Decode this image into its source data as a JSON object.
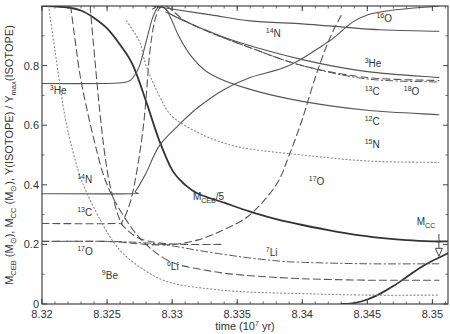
{
  "chart_data": {
    "type": "line",
    "title": "",
    "xlabel": "time (10^7 yr)",
    "xlabel_parts": {
      "base": "time (10",
      "sup": "7",
      "tail": " yr)"
    },
    "ylabel": "M_CEB (M_sun), M_CC (M_sun), Y(ISOTOPE)/Y_max(ISOTOPE)",
    "xlim": [
      8.32,
      8.3512
    ],
    "ylim": [
      0,
      1.0
    ],
    "x_ticks": [
      {
        "value": 8.32,
        "label": "8.32"
      },
      {
        "value": 8.325,
        "label": "8.325"
      },
      {
        "value": 8.33,
        "label": "8.33"
      },
      {
        "value": 8.335,
        "label": "8.335"
      },
      {
        "value": 8.34,
        "label": "8.34"
      },
      {
        "value": 8.345,
        "label": "8.345"
      },
      {
        "value": 8.35,
        "label": "8.35"
      }
    ],
    "y_ticks": [
      {
        "value": 0,
        "label": "0"
      },
      {
        "value": 0.2,
        "label": "0.2"
      },
      {
        "value": 0.4,
        "label": "0.4"
      },
      {
        "value": 0.6,
        "label": "0.6"
      },
      {
        "value": 0.8,
        "label": "0.8"
      }
    ],
    "grid": false,
    "legend": "inline labels",
    "series": [
      {
        "name": "M_CEB/5",
        "style": "solid-thick",
        "x": [
          8.32,
          8.322,
          8.323,
          8.324,
          8.325,
          8.326,
          8.327,
          8.328,
          8.329,
          8.33,
          8.331,
          8.332,
          8.334,
          8.336,
          8.338,
          8.34,
          8.342,
          8.344,
          8.346,
          8.348,
          8.35,
          8.3512
        ],
        "y": [
          1.0,
          0.995,
          0.985,
          0.96,
          0.925,
          0.87,
          0.8,
          0.68,
          0.55,
          0.45,
          0.4,
          0.37,
          0.34,
          0.31,
          0.285,
          0.265,
          0.248,
          0.233,
          0.222,
          0.214,
          0.21,
          0.21
        ]
      },
      {
        "name": "M_CC",
        "style": "solid-thick",
        "x": [
          8.343,
          8.344,
          8.345,
          8.346,
          8.347,
          8.348,
          8.349,
          8.35,
          8.3512
        ],
        "y": [
          0.0,
          0.003,
          0.015,
          0.035,
          0.06,
          0.09,
          0.12,
          0.145,
          0.17
        ]
      },
      {
        "name": "3He",
        "style": "solid",
        "x": [
          8.32,
          8.325,
          8.3265,
          8.327,
          8.3275,
          8.328,
          8.3285,
          8.329,
          8.3295,
          8.33,
          8.332,
          8.335,
          8.34,
          8.345,
          8.3505
        ],
        "y": [
          0.74,
          0.74,
          0.745,
          0.76,
          0.8,
          0.88,
          0.96,
          1.0,
          0.99,
          0.97,
          0.93,
          0.88,
          0.82,
          0.78,
          0.76
        ]
      },
      {
        "name": "14N",
        "style": "solid",
        "x": [
          8.32,
          8.3268,
          8.3272,
          8.328,
          8.329,
          8.3305,
          8.332,
          8.334,
          8.336,
          8.339,
          8.342,
          8.345,
          8.3505
        ],
        "y": [
          0.37,
          0.37,
          0.38,
          0.44,
          0.53,
          0.6,
          0.66,
          0.72,
          0.76,
          0.8,
          0.88,
          0.97,
          1.0
        ]
      },
      {
        "name": "12C",
        "style": "solid",
        "x": [
          8.3285,
          8.329,
          8.3295,
          8.33,
          8.3305,
          8.3315,
          8.333,
          8.336,
          8.34,
          8.345,
          8.3505
        ],
        "y": [
          0.99,
          1.0,
          0.99,
          0.95,
          0.9,
          0.83,
          0.77,
          0.72,
          0.68,
          0.65,
          0.635
        ]
      },
      {
        "name": "16O",
        "style": "solid",
        "x": [
          8.3285,
          8.33,
          8.333,
          8.336,
          8.34,
          8.343,
          8.346,
          8.3505
        ],
        "y": [
          1.0,
          0.99,
          0.97,
          0.95,
          0.94,
          0.93,
          0.92,
          0.915
        ]
      },
      {
        "name": "13C",
        "style": "dashed",
        "x": [
          8.32,
          8.3255,
          8.3262,
          8.327,
          8.3278,
          8.3283,
          8.3288,
          8.3295,
          8.331,
          8.333,
          8.336,
          8.34,
          8.345,
          8.3505
        ],
        "y": [
          0.27,
          0.27,
          0.28,
          0.38,
          0.6,
          0.85,
          0.97,
          1.0,
          0.95,
          0.91,
          0.86,
          0.8,
          0.76,
          0.75
        ]
      },
      {
        "name": "18O",
        "style": "dash-dot",
        "x": [
          8.3295,
          8.331,
          8.333,
          8.336,
          8.34,
          8.345,
          8.3505
        ],
        "y": [
          0.98,
          0.95,
          0.91,
          0.86,
          0.8,
          0.755,
          0.745
        ]
      },
      {
        "name": "17O",
        "style": "dashed",
        "x": [
          8.32,
          8.325,
          8.328,
          8.33,
          8.332,
          8.334,
          8.336,
          8.338,
          8.339,
          8.34,
          8.341,
          8.342,
          8.343
        ],
        "y": [
          0.21,
          0.21,
          0.2,
          0.2,
          0.215,
          0.25,
          0.3,
          0.4,
          0.5,
          0.62,
          0.76,
          0.88,
          0.97
        ]
      },
      {
        "name": "15N",
        "style": "dotted",
        "x": [
          8.3265,
          8.3275,
          8.328,
          8.329,
          8.33,
          8.332,
          8.334,
          8.336,
          8.34,
          8.345,
          8.3505
        ],
        "y": [
          0.95,
          0.88,
          0.8,
          0.7,
          0.63,
          0.575,
          0.54,
          0.52,
          0.5,
          0.48,
          0.475
        ]
      },
      {
        "name": "7Li",
        "style": "dash-dot",
        "x": [
          8.32,
          8.325,
          8.328,
          8.33,
          8.332,
          8.335,
          8.338,
          8.34,
          8.345,
          8.3505
        ],
        "y": [
          0.21,
          0.21,
          0.205,
          0.195,
          0.18,
          0.16,
          0.145,
          0.14,
          0.135,
          0.135
        ]
      },
      {
        "name": "6Li",
        "style": "dashed",
        "x": [
          8.3222,
          8.3225,
          8.323,
          8.324,
          8.325,
          8.3265,
          8.328,
          8.33,
          8.333,
          8.336,
          8.34,
          8.345,
          8.3505
        ],
        "y": [
          1.0,
          0.9,
          0.75,
          0.55,
          0.4,
          0.28,
          0.2,
          0.14,
          0.11,
          0.095,
          0.085,
          0.08,
          0.08
        ]
      },
      {
        "name": "9Be",
        "style": "dotted",
        "x": [
          8.3205,
          8.321,
          8.3215,
          8.322,
          8.323,
          8.3245,
          8.326,
          8.328,
          8.33,
          8.333,
          8.336,
          8.34,
          8.345,
          8.3505
        ],
        "y": [
          1.0,
          0.85,
          0.7,
          0.58,
          0.42,
          0.28,
          0.18,
          0.11,
          0.07,
          0.05,
          0.04,
          0.035,
          0.03,
          0.03
        ]
      },
      {
        "name": "extra-dashed-left",
        "style": "dashed",
        "x": [
          8.3237,
          8.324,
          8.3245,
          8.325,
          8.3255,
          8.326,
          8.3265,
          8.3275,
          8.329,
          8.331,
          8.334
        ],
        "y": [
          1.0,
          0.85,
          0.62,
          0.45,
          0.35,
          0.28,
          0.25,
          0.22,
          0.205,
          0.2,
          0.2
        ]
      }
    ],
    "annotations": [
      {
        "text": "3He",
        "sup": "3",
        "base": "He",
        "x": 8.3206,
        "y": 0.705
      },
      {
        "text": "14N",
        "sup": "14",
        "base": "N",
        "x": 8.3227,
        "y": 0.405
      },
      {
        "text": "13C",
        "sup": "13",
        "base": "C",
        "x": 8.3227,
        "y": 0.295
      },
      {
        "text": "17O",
        "sup": "17",
        "base": "O",
        "x": 8.3227,
        "y": 0.165
      },
      {
        "text": "9Be",
        "sup": "9",
        "base": "Be",
        "x": 8.3246,
        "y": 0.085
      },
      {
        "text": "6Li",
        "sup": "6",
        "base": "Li",
        "x": 8.3296,
        "y": 0.115
      },
      {
        "text": "7Li",
        "sup": "7",
        "base": "Li",
        "x": 8.3372,
        "y": 0.16
      },
      {
        "text": "M_CEB/5",
        "base": "M",
        "sub": "CEB",
        "tail": "/5",
        "x": 8.3316,
        "y": 0.35
      },
      {
        "text": "17O",
        "sup": "17",
        "base": "O",
        "x": 8.3405,
        "y": 0.4
      },
      {
        "text": "14N",
        "sup": "14",
        "base": "N",
        "x": 8.3372,
        "y": 0.895
      },
      {
        "text": "16O",
        "sup": "16",
        "base": "O",
        "x": 8.3457,
        "y": 0.945
      },
      {
        "text": "3He",
        "sup": "3",
        "base": "He",
        "x": 8.3448,
        "y": 0.795
      },
      {
        "text": "13C",
        "sup": "13",
        "base": "C",
        "x": 8.3448,
        "y": 0.7
      },
      {
        "text": "18O",
        "sup": "18",
        "base": "O",
        "x": 8.3478,
        "y": 0.7
      },
      {
        "text": "12C",
        "sup": "12",
        "base": "C",
        "x": 8.3448,
        "y": 0.6
      },
      {
        "text": "15N",
        "sup": "15",
        "base": "N",
        "x": 8.3448,
        "y": 0.525
      },
      {
        "text": "M_CC",
        "base": "M",
        "sub": "CC",
        "x": 8.3488,
        "y": 0.265
      }
    ],
    "arrow": {
      "label": "M_CC",
      "x": 8.3505,
      "y_from": 0.235,
      "y_to": 0.16
    }
  },
  "colors": {
    "axis": "#444444",
    "line": "#555555",
    "thick_line": "#333333",
    "dotted": "#888888",
    "text": "#333333"
  }
}
